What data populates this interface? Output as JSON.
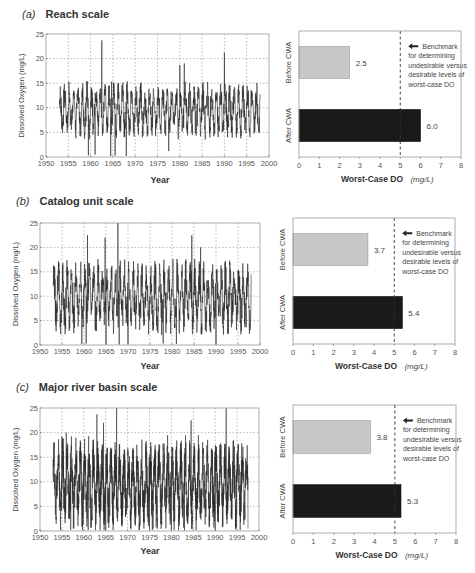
{
  "chart_data": [
    {
      "panel": "a",
      "type": "line",
      "title": "Reach scale",
      "label": "(a)",
      "xlabel": "Year",
      "ylabel": "Dissolved Oxygen (mg/L)",
      "xlim": [
        1950,
        2000
      ],
      "ylim": [
        0,
        25
      ],
      "xticks": [
        1950,
        1955,
        1960,
        1965,
        1970,
        1975,
        1980,
        1985,
        1990,
        1995,
        2000
      ],
      "yticks": [
        0,
        5,
        10,
        15,
        20,
        25
      ],
      "grid": true,
      "series": [
        {
          "name": "Dissolved Oxygen",
          "x_start": 1953,
          "x_end": 1998,
          "mean": 9.5,
          "amplitude": 3.5,
          "noise": 2.5,
          "peaks": [
            [
              1962.5,
              23.7
            ],
            [
              1964.7,
              15.3
            ],
            [
              1980,
              18.7
            ],
            [
              1981,
              19.0
            ],
            [
              1990,
              21.2
            ]
          ],
          "troughs": [
            [
              1959.5,
              0.3
            ],
            [
              1961,
              0.5
            ],
            [
              1964.5,
              0.2
            ],
            [
              1965.5,
              0.3
            ],
            [
              1968,
              0.2
            ],
            [
              1977.5,
              1.2
            ]
          ]
        }
      ]
    },
    {
      "panel": "a",
      "type": "bar",
      "orientation": "horizontal",
      "categories": [
        "Before CWA",
        "After CWA"
      ],
      "values": [
        2.5,
        6.0
      ],
      "value_labels": [
        "2.5",
        "6.0"
      ],
      "colors": [
        "#c8c8c8",
        "#1a1a1a"
      ],
      "xlabel": "Worst-Case DO",
      "xlabel_unit": "(mg/L)",
      "xlim": [
        0,
        8
      ],
      "xticks": [
        0,
        1,
        2,
        3,
        4,
        5,
        6,
        7,
        8
      ],
      "benchmark": 5,
      "annotation": [
        "Benchmark",
        "for determining",
        "undesirable versus",
        "desirable levels of",
        "worst-case DO"
      ]
    },
    {
      "panel": "b",
      "type": "line",
      "title": "Catalog unit scale",
      "label": "(b)",
      "xlabel": "Year",
      "ylabel": "Dissolved Oxygen (mg/L)",
      "xlim": [
        1950,
        2000
      ],
      "ylim": [
        0,
        25
      ],
      "xticks": [
        1950,
        1955,
        1960,
        1965,
        1970,
        1975,
        1980,
        1985,
        1990,
        1995,
        2000
      ],
      "yticks": [
        0,
        5,
        10,
        15,
        20,
        25
      ],
      "grid": true,
      "series": [
        {
          "name": "Dissolved Oxygen",
          "x_start": 1953,
          "x_end": 1998,
          "mean": 9.8,
          "amplitude": 4.5,
          "noise": 3.5,
          "peaks": [
            [
              1960.8,
              22.5
            ],
            [
              1964.8,
              22.0
            ],
            [
              1967.7,
              25.0
            ],
            [
              1981,
              19.0
            ],
            [
              1984.5,
              22.5
            ],
            [
              1986.5,
              20.0
            ],
            [
              1990,
              17.5
            ]
          ],
          "troughs": [
            [
              1959.5,
              0.2
            ],
            [
              1960.5,
              0.3
            ],
            [
              1965,
              0.1
            ],
            [
              1968,
              0.1
            ],
            [
              1970,
              0.2
            ],
            [
              1978,
              0.3
            ],
            [
              1981,
              0.2
            ],
            [
              1990,
              0.1
            ]
          ]
        }
      ]
    },
    {
      "panel": "b",
      "type": "bar",
      "orientation": "horizontal",
      "categories": [
        "Before CWA",
        "After CWA"
      ],
      "values": [
        3.7,
        5.4
      ],
      "value_labels": [
        "3.7",
        "5.4"
      ],
      "colors": [
        "#c8c8c8",
        "#1a1a1a"
      ],
      "xlabel": "Worst-Case DO",
      "xlabel_unit": "(mg/L)",
      "xlim": [
        0,
        8
      ],
      "xticks": [
        0,
        1,
        2,
        3,
        4,
        5,
        6,
        7,
        8
      ],
      "benchmark": 5,
      "annotation": [
        "Benchmark",
        "for determining",
        "undesirable versus",
        "desirable levels of",
        "worst-case DO"
      ]
    },
    {
      "panel": "c",
      "type": "line",
      "title": "Major river basin scale",
      "label": "(c)",
      "xlabel": "Year",
      "ylabel": "Dissolved Oxygen (mg/L)",
      "xlim": [
        1950,
        2000
      ],
      "ylim": [
        0,
        25
      ],
      "xticks": [
        1950,
        1955,
        1960,
        1965,
        1970,
        1975,
        1980,
        1985,
        1990,
        1995,
        2000
      ],
      "yticks": [
        0,
        5,
        10,
        15,
        20,
        25
      ],
      "grid": true,
      "series": [
        {
          "name": "Dissolved Oxygen",
          "x_start": 1953,
          "x_end": 1997.5,
          "mean": 9.5,
          "amplitude": 5.5,
          "noise": 4.5,
          "peaks": [
            [
              1955,
              19.2
            ],
            [
              1956,
              20.0
            ],
            [
              1961,
              22.5
            ],
            [
              1963,
              23.7
            ],
            [
              1964.5,
              22.0
            ],
            [
              1967.5,
              25.0
            ],
            [
              1980,
              23.5
            ],
            [
              1984.5,
              22.5
            ],
            [
              1990,
              25.0
            ],
            [
              1992.5,
              25.0
            ]
          ],
          "troughs": [
            [
              1957,
              0.2
            ],
            [
              1961,
              0.2
            ],
            [
              1965,
              0.1
            ],
            [
              1975,
              0.2
            ],
            [
              1980,
              0.1
            ],
            [
              1983,
              0.1
            ],
            [
              1990,
              0.1
            ],
            [
              1997.5,
              0.5
            ]
          ]
        }
      ]
    },
    {
      "panel": "c",
      "type": "bar",
      "orientation": "horizontal",
      "categories": [
        "Before CWA",
        "After CWA"
      ],
      "values": [
        3.8,
        5.3
      ],
      "value_labels": [
        "3.8",
        "5.3"
      ],
      "colors": [
        "#c8c8c8",
        "#1a1a1a"
      ],
      "xlabel": "Worst-Case DO",
      "xlabel_unit": "(mg/L)",
      "xlim": [
        0,
        8
      ],
      "xticks": [
        0,
        1,
        2,
        3,
        4,
        5,
        6,
        7,
        8
      ],
      "benchmark": 5,
      "annotation": [
        "Benchmark",
        "for determining",
        "undesirable versus",
        "desirable levels of",
        "worst-case DO"
      ]
    }
  ],
  "panels": [
    {
      "label": "(a)",
      "title": "Reach scale"
    },
    {
      "label": "(b)",
      "title": "Catalog unit scale"
    },
    {
      "label": "(c)",
      "title": "Major river basin scale"
    }
  ]
}
